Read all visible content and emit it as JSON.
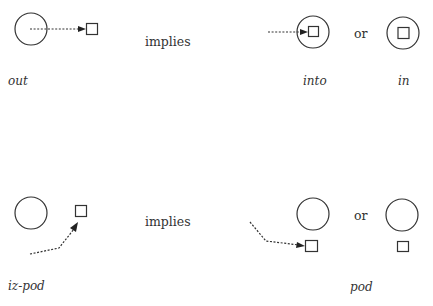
{
  "diagram": {
    "rows": [
      {
        "name": "out-into",
        "left_label": "out",
        "connector": "implies",
        "option_separator": "or",
        "result_labels": [
          "into",
          "in"
        ]
      },
      {
        "name": "izpod-pod",
        "left_label": "iz-pod",
        "connector": "implies",
        "option_separator": "or",
        "result_labels": [
          "pod"
        ]
      }
    ],
    "colors": {
      "stroke": "#333333",
      "background": "#ffffff"
    }
  }
}
